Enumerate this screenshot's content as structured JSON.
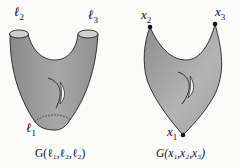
{
  "figures": [
    {
      "id": "pants",
      "labels": {
        "l1": "ℓ",
        "l1_sub": "1",
        "l2": "ℓ",
        "l2_sub": "2",
        "l3": "ℓ",
        "l3_sub": "3"
      },
      "caption": "G(ℓ₁,ℓ₂,ℓ₂)"
    },
    {
      "id": "triangle",
      "labels": {
        "x1": "x",
        "x1_sub": "1",
        "x2": "x",
        "x2_sub": "2",
        "x3": "x",
        "x3_sub": "3"
      },
      "caption": "G(x₁,x₂,x₃)"
    }
  ],
  "colors": {
    "fill": "#9a9a9a",
    "fill_light": "#c8c8c8",
    "stroke": "#222222",
    "background": "#fbfbf9"
  }
}
